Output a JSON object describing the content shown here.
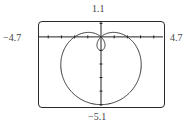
{
  "chart_data": {
    "type": "line",
    "subtype": "polar",
    "title": "",
    "equation": "r = 2 - 3 sin(theta)",
    "a": 2,
    "b": 3,
    "theta_range": [
      0,
      6.2832
    ],
    "window": {
      "xmin": -4.7,
      "xmax": 4.7,
      "ymin": -5.1,
      "ymax": 1.1
    },
    "xlim": [
      -4.7,
      4.7
    ],
    "ylim": [
      -5.1,
      1.1
    ],
    "tick_step": 1,
    "grid": false,
    "legend": null,
    "xlabel": "",
    "ylabel": "",
    "window_labels": {
      "top": "1.1",
      "bottom": "−5.1",
      "left": "−4.7",
      "right": "4.7"
    },
    "colors": {
      "curve": "#333333",
      "axes": "#222222",
      "frame": "#2a2a2a"
    }
  }
}
